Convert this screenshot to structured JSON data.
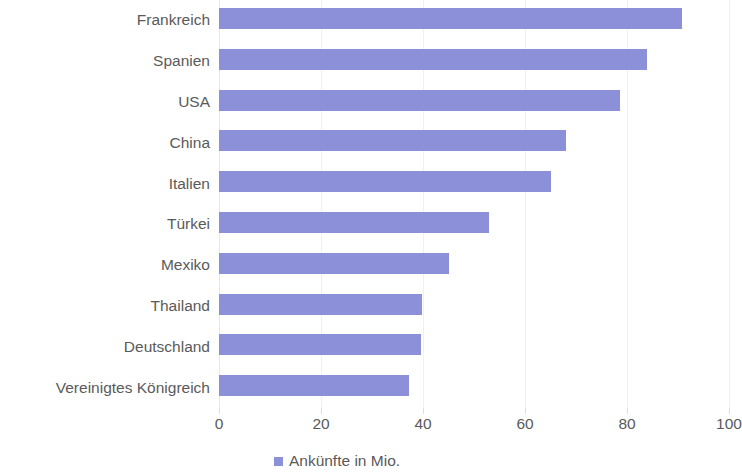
{
  "chart_data": {
    "type": "bar",
    "orientation": "horizontal",
    "title": "",
    "subtitle": "",
    "xlabel": "",
    "ylabel": "",
    "categories": [
      "Frankreich",
      "Spanien",
      "USA",
      "China",
      "Italien",
      "Türkei",
      "Mexiko",
      "Thailand",
      "Deutschland",
      "Vereinigtes Königreich"
    ],
    "series": [
      {
        "name": "Ankünfte in Mio.",
        "values": [
          90.8,
          83.9,
          78.6,
          68.0,
          65.1,
          52.9,
          45.1,
          39.8,
          39.6,
          37.3
        ]
      }
    ],
    "values": [
      90.8,
      83.9,
      78.6,
      68.0,
      65.1,
      52.9,
      45.1,
      39.8,
      39.6,
      37.3
    ],
    "xlim": [
      0,
      100
    ],
    "xticks": [
      0,
      20,
      40,
      60,
      80,
      100
    ],
    "xtick_labels": [
      "0",
      "20",
      "40",
      "60",
      "80",
      "100"
    ],
    "gridlines": "vertical",
    "grid": true,
    "legend": {
      "position": "bottom",
      "entries": [
        {
          "label": "Ankünfte in Mio.",
          "color": "#8b90d8",
          "marker": "square"
        }
      ]
    },
    "colors": {
      "bar": "#8b90d8",
      "gridline": "#eff0f2",
      "axis": "#e6e7e9",
      "text": "#5a5a5a",
      "background": "#ffffff"
    }
  }
}
